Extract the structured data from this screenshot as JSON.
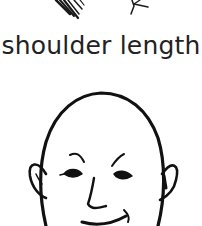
{
  "caption": "shoulder length",
  "illustration": {
    "top_strokes": "hair-strokes-partial",
    "figure": "bald-head-face-drawing",
    "line_color": "#111111",
    "background": "#ffffff"
  }
}
